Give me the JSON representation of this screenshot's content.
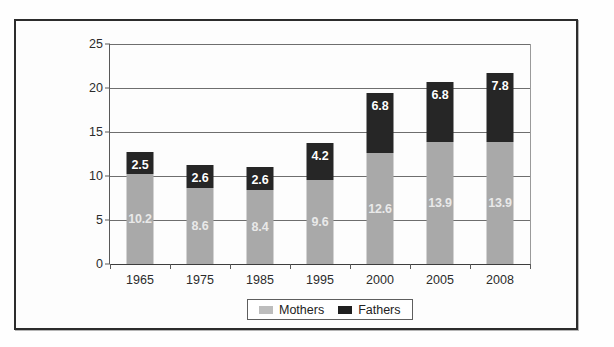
{
  "chart_data": {
    "type": "bar",
    "subtype": "stacked-bar",
    "title": "",
    "xlabel": "",
    "ylabel": "",
    "ylim": [
      0,
      25
    ],
    "yticks": [
      0,
      5,
      10,
      15,
      20,
      25
    ],
    "grid": true,
    "legend_position": "bottom",
    "categories": [
      "1965",
      "1975",
      "1985",
      "1995",
      "2000",
      "2005",
      "2008"
    ],
    "series": [
      {
        "name": "Mothers",
        "color": "#a9a9a9",
        "values": [
          10.2,
          8.6,
          8.4,
          9.6,
          12.6,
          13.9,
          13.9
        ]
      },
      {
        "name": "Fathers",
        "color": "#262626",
        "values": [
          2.5,
          2.6,
          2.6,
          4.2,
          6.8,
          6.8,
          7.8
        ]
      }
    ],
    "totals": [
      12.7,
      11.2,
      11.0,
      13.8,
      19.4,
      20.7,
      21.7
    ]
  },
  "axis": {
    "y_tick_labels": [
      "0",
      "5",
      "10",
      "15",
      "20",
      "25"
    ],
    "x_tick_labels": [
      "1965",
      "1975",
      "1985",
      "1995",
      "2000",
      "2005",
      "2008"
    ]
  },
  "legend": {
    "entries": [
      {
        "label": "Mothers",
        "swatch": "mothers-swatch"
      },
      {
        "label": "Fathers",
        "swatch": "fathers-swatch"
      }
    ]
  },
  "colors": {
    "mothers": "#a9a9a9",
    "fathers": "#262626",
    "frame": "#2c2c2c",
    "grid": "#6e6e6e",
    "text": "#2b2b2b",
    "bar_label": "#ffffff"
  },
  "top_remnant": ""
}
